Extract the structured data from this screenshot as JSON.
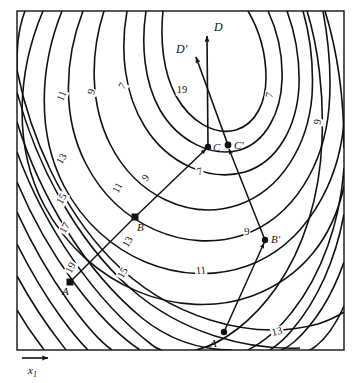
{
  "figure": {
    "type": "contour-plot",
    "axis": {
      "label": "x1",
      "label_display": "x",
      "subscript": "1",
      "arrow": "right-arrow-icon"
    },
    "frame": {
      "x": 17,
      "y": 11,
      "width": 327,
      "height": 339,
      "stroke": "#111111"
    },
    "background": "#ffffff",
    "line_color": "#111111"
  },
  "chart_data": {
    "type": "contour",
    "title": "",
    "xlabel": "x1",
    "ylabel": "",
    "contour_levels": [
      7,
      9,
      11,
      13,
      15,
      17,
      19
    ],
    "level_labels": [
      {
        "text": "11",
        "x": 62,
        "y": 96,
        "rot": -68
      },
      {
        "text": "9",
        "x": 92,
        "y": 92,
        "rot": -72
      },
      {
        "text": "7",
        "x": 123,
        "y": 86,
        "rot": -60
      },
      {
        "text": "13",
        "x": 62,
        "y": 159,
        "rot": -60
      },
      {
        "text": "15",
        "x": 62,
        "y": 199,
        "rot": -62
      },
      {
        "text": "17",
        "x": 65,
        "y": 228,
        "rot": -62
      },
      {
        "text": "19",
        "x": 71,
        "y": 268,
        "rot": -62
      },
      {
        "text": "11",
        "x": 118,
        "y": 188,
        "rot": -62
      },
      {
        "text": "9",
        "x": 146,
        "y": 178,
        "rot": -55
      },
      {
        "text": "13",
        "x": 128,
        "y": 242,
        "rot": -60
      },
      {
        "text": "15",
        "x": 123,
        "y": 273,
        "rot": -60
      },
      {
        "text": "7",
        "x": 200,
        "y": 172,
        "rot": -18
      },
      {
        "text": "19",
        "x": 182,
        "y": 90,
        "rot": 0
      },
      {
        "text": "7",
        "x": 270,
        "y": 95,
        "rot": -78
      },
      {
        "text": "9",
        "x": 318,
        "y": 122,
        "rot": -80
      },
      {
        "text": "9",
        "x": 247,
        "y": 232,
        "rot": -4
      },
      {
        "text": "11",
        "x": 201,
        "y": 271,
        "rot": -6
      },
      {
        "text": "13",
        "x": 277,
        "y": 332,
        "rot": -14
      }
    ],
    "points": [
      {
        "name": "A",
        "x": 70,
        "y": 282,
        "marker": "square",
        "label": "A",
        "label_dx": -4,
        "label_dy": 7
      },
      {
        "name": "B",
        "x": 135,
        "y": 217,
        "marker": "square",
        "label": "B",
        "label_dx": 2,
        "label_dy": 7
      },
      {
        "name": "C",
        "x": 208,
        "y": 147,
        "marker": "dot",
        "label": "C",
        "label_dx": 4,
        "label_dy": -2
      },
      {
        "name": "A'",
        "x": 224,
        "y": 332,
        "marker": "dot",
        "label": "A'",
        "label_dx": -12,
        "label_dy": 8
      },
      {
        "name": "B'",
        "x": 265,
        "y": 240,
        "marker": "dot",
        "label": "B'",
        "label_dx": 5,
        "label_dy": -1
      },
      {
        "name": "C'",
        "x": 228,
        "y": 145,
        "marker": "dot",
        "label": "C'",
        "label_dx": 5,
        "label_dy": 0
      }
    ],
    "vectors": [
      {
        "name": "D",
        "from_point": "C",
        "tip_x": 207,
        "tip_y": 32,
        "label": "D",
        "label_x": 214,
        "label_y": 26
      },
      {
        "name": "D'",
        "from_point": "C'",
        "tip_x": 194,
        "tip_y": 54,
        "label": "D'",
        "label_x": 178,
        "label_y": 48
      }
    ],
    "paths": [
      {
        "name": "path-ABC",
        "nodes": [
          "A",
          "B",
          "C"
        ],
        "arrowheads": [
          "C"
        ]
      },
      {
        "name": "path-ABC-pr",
        "nodes": [
          "A'",
          "B'",
          "C'"
        ],
        "arrowheads": [
          "B'",
          "C'"
        ]
      }
    ]
  }
}
